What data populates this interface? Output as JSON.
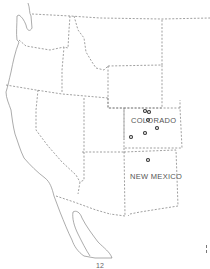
{
  "map": {
    "type": "regional outline map of western United States",
    "labels": [
      {
        "id": "colorado",
        "text": "COLORADO"
      },
      {
        "id": "new-mexico",
        "text": "NEW MEXICO"
      }
    ],
    "points": [
      {
        "x": 145,
        "y": 111
      },
      {
        "x": 149,
        "y": 112
      },
      {
        "x": 148,
        "y": 120
      },
      {
        "x": 157,
        "y": 128
      },
      {
        "x": 145,
        "y": 133
      },
      {
        "x": 131,
        "y": 137
      },
      {
        "x": 148,
        "y": 160
      }
    ],
    "colors": {
      "border": "#777777",
      "point": "#333333",
      "background": "#ffffff"
    }
  },
  "page": {
    "number": "12"
  }
}
